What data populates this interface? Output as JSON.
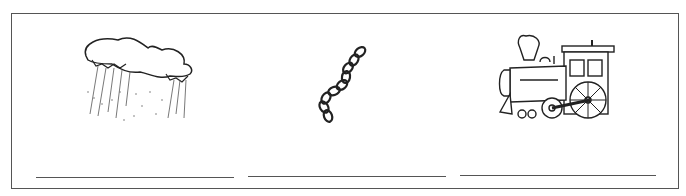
{
  "worksheet": {
    "items": [
      {
        "picture": "rain-cloud",
        "answer": ""
      },
      {
        "picture": "chain",
        "answer": ""
      },
      {
        "picture": "steam-train",
        "answer": ""
      }
    ]
  }
}
